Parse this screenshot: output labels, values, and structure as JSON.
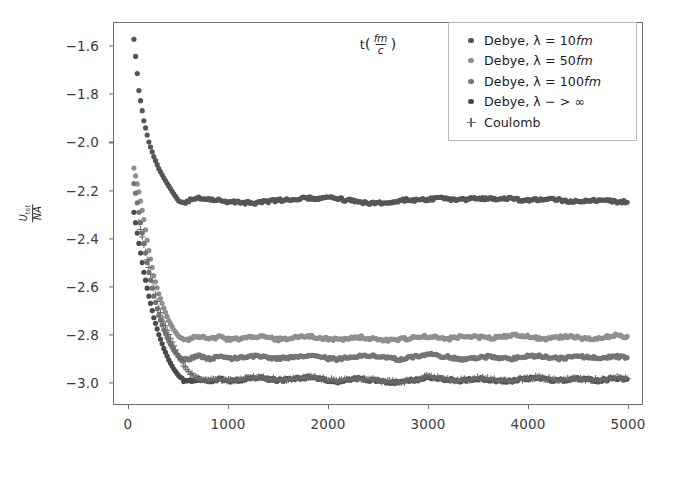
{
  "chart_data": {
    "type": "scatter",
    "title": "",
    "xlabel": "t(fm/c)",
    "ylabel": "U_tot/NA",
    "xlabel_parts": {
      "base": "t",
      "num": "fm",
      "den": "c"
    },
    "ylabel_parts": {
      "num": "U",
      "num_sub": "tot",
      "den": "NA"
    },
    "xlim": [
      -150,
      5150
    ],
    "ylim": [
      -3.09,
      -1.5
    ],
    "xticks": [
      0,
      1000,
      2000,
      3000,
      4000,
      5000
    ],
    "xticklabels": [
      "0",
      "1000",
      "2000",
      "3000",
      "4000",
      "5000"
    ],
    "yticks": [
      -1.6,
      -1.8,
      -2.0,
      -2.2,
      -2.4,
      -2.6,
      -2.8,
      -3.0
    ],
    "yticklabels": [
      "−1.6",
      "−1.8",
      "−2.0",
      "−2.2",
      "−2.4",
      "−2.6",
      "−2.8",
      "−3.0"
    ],
    "grid": false,
    "legend_position": "upper right",
    "series": [
      {
        "name": "Debye, λ = 10fm",
        "label_base": "Debye, λ = 10",
        "label_italic": "fm",
        "marker": "o",
        "color": "#555555",
        "plateau": -2.235,
        "x": [
          50,
          100,
          150,
          200,
          250,
          300,
          350,
          400,
          450,
          500,
          550,
          600,
          650,
          700,
          750,
          800,
          850,
          900,
          950,
          1000,
          1100,
          1200,
          1300,
          1400,
          1500,
          1600,
          1700,
          1800,
          1900,
          2000,
          2100,
          2200,
          2300,
          2400,
          2500,
          2600,
          2700,
          2800,
          2900,
          3000,
          3100,
          3200,
          3300,
          3400,
          3500,
          3600,
          3700,
          3800,
          3900,
          4000,
          4100,
          4200,
          4300,
          4400,
          4500,
          4600,
          4700,
          4800,
          4900,
          5000
        ],
        "y": [
          -1.568,
          -1.782,
          -1.908,
          -1.997,
          -2.058,
          -2.108,
          -2.146,
          -2.18,
          -2.213,
          -2.243,
          -2.251,
          -2.24,
          -2.232,
          -2.228,
          -2.231,
          -2.236,
          -2.238,
          -2.241,
          -2.244,
          -2.245,
          -2.248,
          -2.251,
          -2.25,
          -2.245,
          -2.241,
          -2.236,
          -2.232,
          -2.23,
          -2.233,
          -2.228,
          -2.234,
          -2.24,
          -2.246,
          -2.25,
          -2.252,
          -2.248,
          -2.242,
          -2.238,
          -2.24,
          -2.236,
          -2.231,
          -2.234,
          -2.24,
          -2.236,
          -2.23,
          -2.233,
          -2.238,
          -2.232,
          -2.236,
          -2.241,
          -2.238,
          -2.234,
          -2.237,
          -2.242,
          -2.245,
          -2.241,
          -2.238,
          -2.242,
          -2.246,
          -2.248
        ]
      },
      {
        "name": "Debye, λ = 50fm",
        "label_base": "Debye, λ = 50",
        "label_italic": "fm",
        "marker": "o",
        "color": "#8f8f8f",
        "plateau": -2.812,
        "x": [
          50,
          100,
          150,
          200,
          250,
          300,
          350,
          400,
          450,
          500,
          550,
          600,
          650,
          700,
          750,
          800,
          850,
          900,
          950,
          1000,
          1100,
          1200,
          1300,
          1400,
          1500,
          1600,
          1700,
          1800,
          1900,
          2000,
          2100,
          2200,
          2300,
          2400,
          2500,
          2600,
          2700,
          2800,
          2900,
          3000,
          3100,
          3200,
          3300,
          3400,
          3500,
          3600,
          3700,
          3800,
          3900,
          4000,
          4100,
          4200,
          4300,
          4400,
          4500,
          4600,
          4700,
          4800,
          4900,
          5000
        ],
        "y": [
          -2.105,
          -2.205,
          -2.32,
          -2.45,
          -2.555,
          -2.63,
          -2.69,
          -2.742,
          -2.78,
          -2.808,
          -2.826,
          -2.822,
          -2.812,
          -2.808,
          -2.812,
          -2.818,
          -2.814,
          -2.81,
          -2.815,
          -2.82,
          -2.818,
          -2.812,
          -2.808,
          -2.814,
          -2.82,
          -2.816,
          -2.81,
          -2.806,
          -2.812,
          -2.818,
          -2.822,
          -2.816,
          -2.81,
          -2.814,
          -2.82,
          -2.826,
          -2.822,
          -2.816,
          -2.812,
          -2.808,
          -2.814,
          -2.818,
          -2.812,
          -2.806,
          -2.81,
          -2.816,
          -2.812,
          -2.806,
          -2.802,
          -2.808,
          -2.814,
          -2.818,
          -2.812,
          -2.808,
          -2.812,
          -2.818,
          -2.814,
          -2.808,
          -2.804,
          -2.808
        ]
      },
      {
        "name": "Debye, λ = 100fm",
        "label_base": "Debye, λ = 100",
        "label_italic": "fm",
        "marker": "o",
        "color": "#757575",
        "plateau": -2.898,
        "x": [
          50,
          100,
          150,
          200,
          250,
          300,
          350,
          400,
          450,
          500,
          550,
          600,
          650,
          700,
          750,
          800,
          850,
          900,
          950,
          1000,
          1100,
          1200,
          1300,
          1400,
          1500,
          1600,
          1700,
          1800,
          1900,
          2000,
          2100,
          2200,
          2300,
          2400,
          2500,
          2600,
          2700,
          2800,
          2900,
          3000,
          3100,
          3200,
          3300,
          3400,
          3500,
          3600,
          3700,
          3800,
          3900,
          4000,
          4100,
          4200,
          4300,
          4400,
          4500,
          4600,
          4700,
          4800,
          4900,
          5000
        ],
        "y": [
          -2.17,
          -2.29,
          -2.42,
          -2.54,
          -2.64,
          -2.72,
          -2.78,
          -2.828,
          -2.866,
          -2.892,
          -2.906,
          -2.902,
          -2.894,
          -2.89,
          -2.896,
          -2.902,
          -2.898,
          -2.892,
          -2.896,
          -2.902,
          -2.898,
          -2.892,
          -2.888,
          -2.894,
          -2.9,
          -2.896,
          -2.89,
          -2.886,
          -2.892,
          -2.9,
          -2.904,
          -2.896,
          -2.89,
          -2.886,
          -2.892,
          -2.898,
          -2.904,
          -2.898,
          -2.892,
          -2.88,
          -2.886,
          -2.894,
          -2.9,
          -2.904,
          -2.898,
          -2.892,
          -2.896,
          -2.902,
          -2.898,
          -2.892,
          -2.888,
          -2.894,
          -2.9,
          -2.896,
          -2.89,
          -2.894,
          -2.9,
          -2.896,
          -2.892,
          -2.896
        ]
      },
      {
        "name": "Debye, λ - > ∞",
        "label_base": "Debye, λ − > ∞",
        "label_italic": "",
        "marker": "o",
        "color": "#4a4a4a",
        "plateau": -2.988,
        "x": [
          50,
          100,
          150,
          200,
          250,
          300,
          350,
          400,
          450,
          500,
          550,
          600,
          650,
          700,
          750,
          800,
          850,
          900,
          950,
          1000,
          1100,
          1200,
          1300,
          1400,
          1500,
          1600,
          1700,
          1800,
          1900,
          2000,
          2100,
          2200,
          2300,
          2400,
          2500,
          2600,
          2700,
          2800,
          2900,
          3000,
          3100,
          3200,
          3300,
          3400,
          3500,
          3600,
          3700,
          3800,
          3900,
          4000,
          4100,
          4200,
          4300,
          4400,
          4500,
          4600,
          4700,
          4800,
          4900,
          5000
        ],
        "y": [
          -2.29,
          -2.42,
          -2.54,
          -2.64,
          -2.73,
          -2.8,
          -2.858,
          -2.906,
          -2.944,
          -2.972,
          -2.992,
          -2.996,
          -2.99,
          -2.984,
          -2.988,
          -2.994,
          -2.99,
          -2.984,
          -2.988,
          -2.994,
          -2.99,
          -2.984,
          -2.98,
          -2.986,
          -2.992,
          -2.988,
          -2.982,
          -2.978,
          -2.984,
          -2.99,
          -2.996,
          -2.99,
          -2.984,
          -2.988,
          -2.994,
          -2.998,
          -3.0,
          -2.994,
          -2.988,
          -2.976,
          -2.982,
          -2.988,
          -2.994,
          -2.99,
          -2.984,
          -2.988,
          -2.992,
          -2.996,
          -2.99,
          -2.984,
          -2.98,
          -2.986,
          -2.992,
          -2.988,
          -2.984,
          -2.988,
          -2.992,
          -2.988,
          -2.982,
          -2.986
        ]
      },
      {
        "name": "Coulomb",
        "label_base": "Coulomb",
        "label_italic": "",
        "marker": "+",
        "color": "#6a6a6a",
        "plateau": -2.99,
        "x": [
          100,
          200,
          300,
          400,
          500,
          600,
          700,
          800,
          900,
          1000,
          1100,
          1200,
          1300,
          1400,
          1500,
          1600,
          1700,
          1800,
          1900,
          2000,
          2100,
          2200,
          2300,
          2400,
          2500,
          2600,
          2700,
          2800,
          2900,
          3000,
          3100,
          3200,
          3300,
          3400,
          3500,
          3600,
          3700,
          3800,
          3900,
          4000,
          4100,
          4200,
          4300,
          4400,
          4500,
          4600,
          4700,
          4800,
          4900,
          5000
        ],
        "y": [
          -2.33,
          -2.52,
          -2.69,
          -2.8,
          -2.895,
          -2.96,
          -2.986,
          -2.992,
          -2.986,
          -2.992,
          -2.988,
          -2.982,
          -2.978,
          -2.984,
          -2.99,
          -2.986,
          -2.98,
          -2.976,
          -2.982,
          -2.988,
          -2.994,
          -2.988,
          -2.982,
          -2.986,
          -2.992,
          -2.996,
          -2.998,
          -2.992,
          -2.986,
          -2.974,
          -2.98,
          -2.986,
          -2.992,
          -2.988,
          -2.982,
          -2.986,
          -2.99,
          -2.994,
          -2.988,
          -2.982,
          -2.978,
          -2.984,
          -2.99,
          -2.986,
          -2.982,
          -2.986,
          -2.99,
          -2.986,
          -2.98,
          -2.984
        ]
      }
    ]
  },
  "axes": {
    "frame_color": "#6e6e6e",
    "tick_color": "#3c3c3c"
  }
}
